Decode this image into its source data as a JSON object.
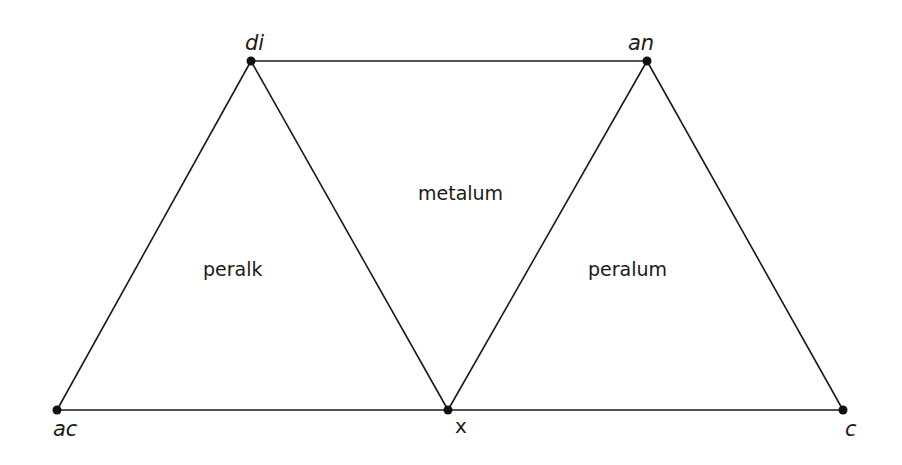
{
  "diagram": {
    "vertices": [
      {
        "id": "di",
        "label": "di",
        "x": 251,
        "y": 61
      },
      {
        "id": "an",
        "label": "an",
        "x": 647,
        "y": 61
      },
      {
        "id": "ac",
        "label": "ac",
        "x": 57,
        "y": 410
      },
      {
        "id": "x",
        "label": "x",
        "x": 448,
        "y": 410
      },
      {
        "id": "c",
        "label": "c",
        "x": 843,
        "y": 410
      }
    ],
    "edges": [
      [
        "di",
        "an"
      ],
      [
        "ac",
        "x"
      ],
      [
        "x",
        "c"
      ],
      [
        "ac",
        "di"
      ],
      [
        "di",
        "x"
      ],
      [
        "x",
        "an"
      ],
      [
        "an",
        "c"
      ]
    ],
    "regions": [
      {
        "id": "peralk",
        "label": "peralk"
      },
      {
        "id": "metalum",
        "label": "metalum"
      },
      {
        "id": "peralum",
        "label": "peralum"
      }
    ]
  }
}
